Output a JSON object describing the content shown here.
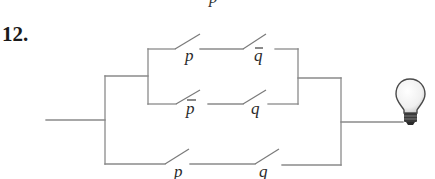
{
  "problem": {
    "number": "12."
  },
  "top_fragment": "p",
  "circuit": {
    "branches": [
      {
        "id": "top",
        "switches": [
          {
            "label": "p",
            "negated": false
          },
          {
            "label": "q",
            "negated": true
          }
        ]
      },
      {
        "id": "middle",
        "switches": [
          {
            "label": "p",
            "negated": true
          },
          {
            "label": "q",
            "negated": false
          }
        ]
      },
      {
        "id": "bottom",
        "switches": [
          {
            "label": "p",
            "negated": false
          },
          {
            "label": "q",
            "negated": false
          }
        ]
      }
    ],
    "output": "light-bulb-icon",
    "colors": {
      "wire": "#8a8a8a",
      "label": "#2a2a2a",
      "bulb_base": "#3a3a3a"
    }
  }
}
